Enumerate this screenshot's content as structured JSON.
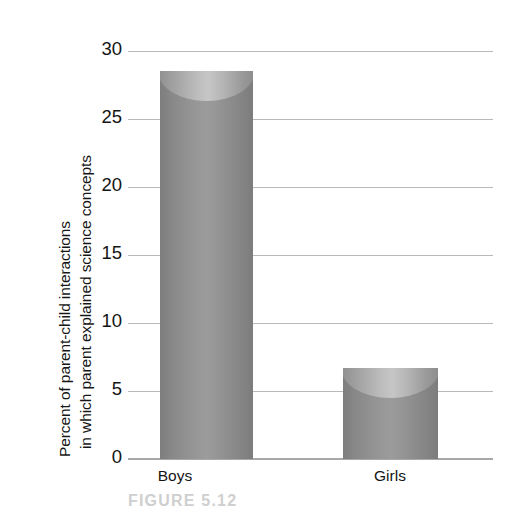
{
  "figure": {
    "background_color": "#ffffff",
    "bar_fill_color": "#cccccc",
    "gridline_color": "#b9b9b9",
    "text_color": "#141414",
    "caption": "FIGURE 5.12"
  },
  "chart_data": {
    "type": "bar",
    "title": "",
    "subtitle": "",
    "xlabel": "",
    "ylabel": "Percent of parent-child interactions in which parent explained science concepts",
    "ylabel_lines": [
      "Percent of parent-child interactions",
      "in which parent explained science concepts"
    ],
    "categories": [
      "Boys",
      "Girls"
    ],
    "values": [
      28.5,
      6.7
    ],
    "series": [
      {
        "name": "Percent of parent-child interactions in which parent explained science concepts",
        "values": [
          28.5,
          6.7
        ]
      }
    ],
    "ylim": [
      0,
      30
    ],
    "yticks": [
      0,
      5,
      10,
      15,
      20,
      25,
      30
    ],
    "ytick_labels": [
      "0",
      "5",
      "10",
      "15",
      "20",
      "25",
      "30"
    ],
    "xtick_labels": [
      "Boys",
      "Girls"
    ],
    "grid": true,
    "grid_axis": "y",
    "legend": false,
    "legend_position": "none",
    "annotations": []
  }
}
